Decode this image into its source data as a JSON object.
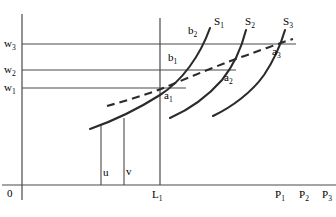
{
  "figure": {
    "type": "economics-line-diagram",
    "title": "",
    "background_color": "#ffffff",
    "line_color": "#3a3a3a",
    "curve_color": "#2b2b2b",
    "text_color": "#000000",
    "width": 336,
    "height": 217
  },
  "axes": {
    "origin_label": "0",
    "y_axis_name": "wage-axis",
    "x_axis_name": "labour-axis",
    "origin_x": 22,
    "origin_y": 185
  },
  "wage_levels": [
    {
      "id": "w1",
      "label": "w",
      "sub": "1",
      "y": 88,
      "line_end_x": 186,
      "label_x": 4,
      "label_y": 83
    },
    {
      "id": "w2",
      "label": "w",
      "sub": "2",
      "y": 70,
      "line_end_x": 236,
      "label_x": 4,
      "label_y": 65
    },
    {
      "id": "w3",
      "label": "w",
      "sub": "3",
      "y": 44,
      "line_end_x": 296,
      "label_x": 4,
      "label_y": 39
    }
  ],
  "supply_curves": [
    {
      "id": "S1",
      "label": "S",
      "sub": "1",
      "label_x": 214,
      "label_y": 17,
      "path": "M 90,129 C 110,122 138,109 160,95 C 182,81 200,56 210,28"
    },
    {
      "id": "S2",
      "label": "S",
      "sub": "2",
      "label_x": 245,
      "label_y": 17,
      "path": "M 170,118 C 188,110 208,96 222,80 C 234,65 242,46 246,30"
    },
    {
      "id": "S3",
      "label": "S",
      "sub": "3",
      "label_x": 283,
      "label_y": 17,
      "path": "M 213,116 C 232,107 252,92 264,75 C 274,60 281,44 285,30"
    }
  ],
  "dashed_curve": {
    "id": "long-run-supply",
    "style": "dashed",
    "path": "M 107,106 C 125,101 145,95 161,89 C 190,77 226,62 250,54 C 264,49 280,43 293,39"
  },
  "intersection_points": [
    {
      "id": "a1",
      "label": "a",
      "sub": "1",
      "label_x": 164,
      "label_y": 93
    },
    {
      "id": "a2",
      "label": "a",
      "sub": "2",
      "label_x": 224,
      "label_y": 75
    },
    {
      "id": "a3",
      "label": "a",
      "sub": "3",
      "label_x": 272,
      "label_y": 49
    }
  ],
  "b_points": [
    {
      "id": "b1",
      "label": "b",
      "sub": "1",
      "label_x": 168,
      "label_y": 55
    },
    {
      "id": "b2",
      "label": "b",
      "sub": "2",
      "label_x": 188,
      "label_y": 28
    }
  ],
  "vertical_lines": [
    {
      "id": "u-line",
      "x": 101,
      "y_top": 124,
      "y_bottom": 185
    },
    {
      "id": "v-line",
      "x": 124,
      "y_top": 118,
      "y_bottom": 185
    },
    {
      "id": "L1-line",
      "x": 160,
      "y_top": 18,
      "y_bottom": 185
    }
  ],
  "quantity_labels": [
    {
      "id": "u",
      "label": "u",
      "sub": "",
      "label_x": 103,
      "label_y": 170
    },
    {
      "id": "v",
      "label": "v",
      "sub": "",
      "label_x": 126,
      "label_y": 169
    },
    {
      "id": "L1",
      "label": "L",
      "sub": "1",
      "label_x": 152,
      "label_y": 192
    }
  ],
  "price_labels": [
    {
      "id": "P1",
      "label": "P",
      "sub": "1",
      "label_x": 275,
      "label_y": 192
    },
    {
      "id": "P2",
      "label": "P",
      "sub": "2",
      "label_x": 299,
      "label_y": 192
    },
    {
      "id": "P3",
      "label": "P",
      "sub": "3",
      "label_x": 322,
      "label_y": 192
    }
  ]
}
